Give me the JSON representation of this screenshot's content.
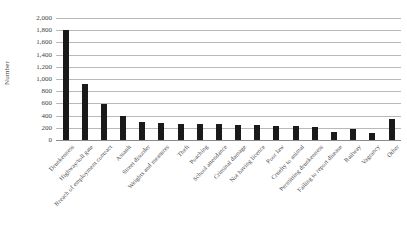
{
  "chart_data": {
    "type": "bar",
    "title": "",
    "xlabel": "",
    "ylabel": "Number",
    "ylim": [
      0,
      2000
    ],
    "ytick_step": 200,
    "grid": true,
    "legend": "none",
    "bar_color": "#1a1a1a",
    "ytick_labels": [
      "2,000",
      "1,800",
      "1,600",
      "1,400",
      "1,200",
      "1,000",
      "800",
      "600",
      "400",
      "200",
      "0"
    ],
    "ytick_values": [
      2000,
      1800,
      1600,
      1400,
      1200,
      1000,
      800,
      600,
      400,
      200,
      0
    ],
    "categories": [
      "Drunkenness",
      "Highway/toll gate",
      "Breach of employment contract",
      "Assault",
      "Street disorder",
      "Weights and measures",
      "Theft",
      "Poaching",
      "School attendance",
      "Criminal damage",
      "Not having licence",
      "Poor law",
      "Cruelty to animal",
      "Permitting drunkenness",
      "Failing to report disease",
      "Railway",
      "Vagrancy",
      "Other"
    ],
    "values": [
      1810,
      920,
      590,
      390,
      300,
      280,
      270,
      265,
      260,
      250,
      245,
      235,
      230,
      215,
      130,
      185,
      120,
      340
    ]
  }
}
